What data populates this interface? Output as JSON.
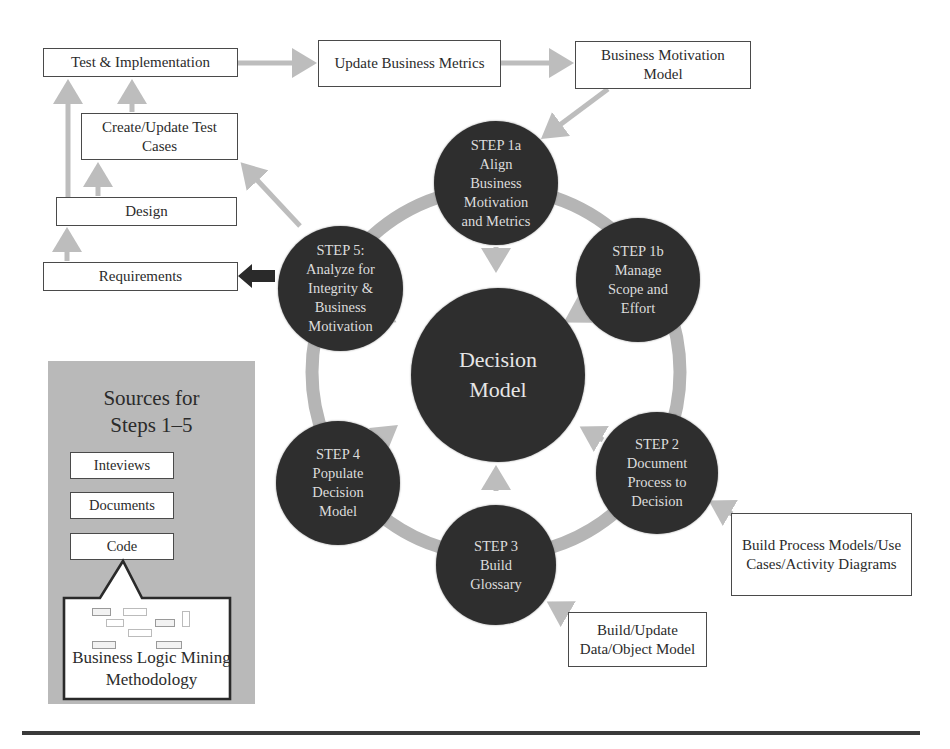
{
  "diagram": {
    "process_boxes": {
      "test_implementation": "Test & Implementation",
      "update_business_metrics": "Update Business Metrics",
      "business_motivation_model": "Business Motivation\nModel",
      "create_update_test_cases": "Create/Update Test\nCases",
      "design": "Design",
      "requirements": "Requirements",
      "build_process_models": "Build Process Models/Use\nCases/Activity Diagrams",
      "build_update_data_model": "Build/Update\nData/Object Model"
    },
    "steps": {
      "step1a": "STEP 1a\nAlign\nBusiness\nMotivation\nand Metrics",
      "step1b": "STEP 1b\nManage\nScope and\nEffort",
      "step2": "STEP 2\nDocument\nProcess to\nDecision",
      "step3": "STEP 3\nBuild\nGlossary",
      "step4": "STEP 4\nPopulate\nDecision\nModel",
      "step5": "STEP 5:\nAnalyze for\nIntegrity &\nBusiness\nMotivation"
    },
    "center": "Decision\nModel",
    "sources_panel": {
      "title": "Sources for\nSteps 1–5",
      "items": [
        "Inteviews",
        "Documents",
        "Code"
      ],
      "callout": "Business Logic Mining\nMethodology"
    },
    "colors": {
      "circle_fill": "#2e2e2e",
      "ring": "#b5b5b5",
      "arrow": "#bdbdbd",
      "dark_arrow": "#2a2a2a",
      "panel_bg": "#b9b9b9",
      "border": "#4a4a4a"
    }
  }
}
